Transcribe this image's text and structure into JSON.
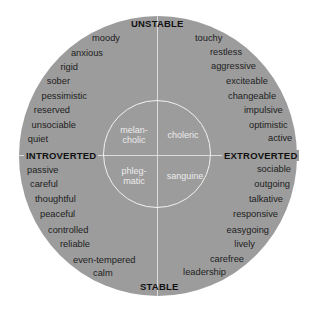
{
  "axes": {
    "top": "UNSTABLE",
    "bottom": "STABLE",
    "left": "INTROVERTED",
    "right": "EXTROVERTED"
  },
  "temperaments": {
    "upper_left": "melan-\ncholic",
    "upper_right": "choleric",
    "lower_left": "phleg-\nmatic",
    "lower_right": "sanguine"
  },
  "quadrants": {
    "unstable_introverted": [
      "moody",
      "anxious",
      "rigid",
      "sober",
      "pessimistic",
      "reserved",
      "unsociable",
      "quiet"
    ],
    "unstable_extroverted": [
      "touchy",
      "restless",
      "aggressive",
      "exciteable",
      "changeable",
      "impulsive",
      "optimistic",
      "active"
    ],
    "stable_introverted": [
      "passive",
      "careful",
      "thoughtful",
      "peaceful",
      "controlled",
      "reliable",
      "even-tempered",
      "calm"
    ],
    "stable_extroverted": [
      "sociable",
      "outgoing",
      "talkative",
      "responsive",
      "easygoing",
      "lively",
      "carefree",
      "leadership"
    ]
  },
  "colors": {
    "disc_fill": "#9c9c9c",
    "text": "#1c1c1c",
    "inner_text": "#ececec",
    "lines": "#dcdcdc"
  }
}
